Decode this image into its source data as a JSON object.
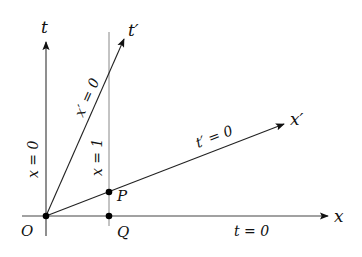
{
  "diagram": {
    "type": "spacetime-diagram",
    "axes": {
      "t": {
        "label": "t"
      },
      "x": {
        "label": "x"
      },
      "t_prime": {
        "label": "t′"
      },
      "x_prime": {
        "label": "x′"
      }
    },
    "line_labels": {
      "x_eq_0": "x = 0",
      "x_prime_eq_0": "x′ = 0",
      "x_eq_1": "x = 1",
      "t_prime_eq_0": "t′ = 0",
      "t_eq_0": "t = 0"
    },
    "points": {
      "O": "O",
      "P": "P",
      "Q": "Q"
    },
    "colors": {
      "axis": "#111111",
      "gridline": "#888888",
      "point": "#000000"
    }
  }
}
